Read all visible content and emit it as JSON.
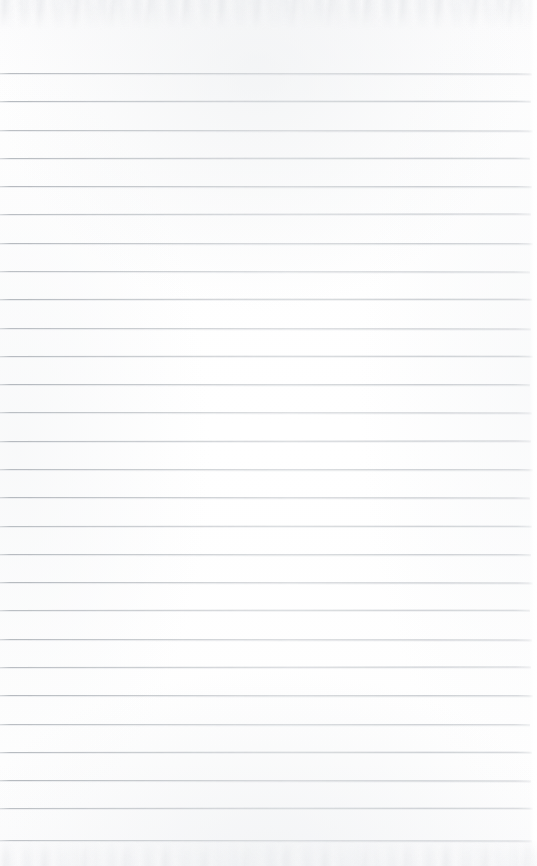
{
  "document": {
    "kind": "scanned-lined-paper",
    "title": "Blank Ruled Notebook Page",
    "written_text": "",
    "page_width": 537,
    "page_height": 866
  },
  "paper": {
    "background_color": "#fdfdfd",
    "edge_noise_color": "#e8eaed",
    "has_vertical_margin_rule": false,
    "has_holes": false,
    "has_handwriting": false,
    "has_printed_text": false
  },
  "ruling": {
    "line_color": "#b4b9bf",
    "line_thickness_px": 1,
    "first_line_y": 73,
    "line_spacing_px": 28.4,
    "line_count": 28,
    "line_start_x": 0,
    "line_end_x": 531,
    "lines": [
      {
        "index": 1,
        "y": 73,
        "tilt_deg": 0.06,
        "end_x": 532,
        "opacity": 0.88
      },
      {
        "index": 2,
        "y": 101,
        "tilt_deg": -0.04,
        "end_x": 531,
        "opacity": 0.92
      },
      {
        "index": 3,
        "y": 130,
        "tilt_deg": 0.05,
        "end_x": 533,
        "opacity": 0.86
      },
      {
        "index": 4,
        "y": 158,
        "tilt_deg": -0.03,
        "end_x": 530,
        "opacity": 0.9
      },
      {
        "index": 5,
        "y": 186,
        "tilt_deg": 0.04,
        "end_x": 532,
        "opacity": 0.93
      },
      {
        "index": 6,
        "y": 214,
        "tilt_deg": -0.05,
        "end_x": 531,
        "opacity": 0.87
      },
      {
        "index": 7,
        "y": 243,
        "tilt_deg": 0.03,
        "end_x": 533,
        "opacity": 0.91
      },
      {
        "index": 8,
        "y": 271,
        "tilt_deg": 0.06,
        "end_x": 530,
        "opacity": 0.85
      },
      {
        "index": 9,
        "y": 299,
        "tilt_deg": -0.04,
        "end_x": 532,
        "opacity": 0.92
      },
      {
        "index": 10,
        "y": 328,
        "tilt_deg": 0.05,
        "end_x": 531,
        "opacity": 0.88
      },
      {
        "index": 11,
        "y": 356,
        "tilt_deg": -0.03,
        "end_x": 533,
        "opacity": 0.9
      },
      {
        "index": 12,
        "y": 384,
        "tilt_deg": 0.04,
        "end_x": 530,
        "opacity": 0.94
      },
      {
        "index": 13,
        "y": 412,
        "tilt_deg": 0.06,
        "end_x": 532,
        "opacity": 0.86
      },
      {
        "index": 14,
        "y": 441,
        "tilt_deg": -0.05,
        "end_x": 531,
        "opacity": 0.91
      },
      {
        "index": 15,
        "y": 469,
        "tilt_deg": 0.03,
        "end_x": 533,
        "opacity": 0.89
      },
      {
        "index": 16,
        "y": 497,
        "tilt_deg": 0.05,
        "end_x": 530,
        "opacity": 0.93
      },
      {
        "index": 17,
        "y": 526,
        "tilt_deg": -0.04,
        "end_x": 532,
        "opacity": 0.87
      },
      {
        "index": 18,
        "y": 554,
        "tilt_deg": 0.04,
        "end_x": 531,
        "opacity": 0.9
      },
      {
        "index": 19,
        "y": 582,
        "tilt_deg": 0.06,
        "end_x": 533,
        "opacity": 0.92
      },
      {
        "index": 20,
        "y": 610,
        "tilt_deg": -0.03,
        "end_x": 530,
        "opacity": 0.86
      },
      {
        "index": 21,
        "y": 639,
        "tilt_deg": 0.05,
        "end_x": 532,
        "opacity": 0.91
      },
      {
        "index": 22,
        "y": 667,
        "tilt_deg": -0.05,
        "end_x": 531,
        "opacity": 0.88
      },
      {
        "index": 23,
        "y": 695,
        "tilt_deg": 0.04,
        "end_x": 533,
        "opacity": 0.93
      },
      {
        "index": 24,
        "y": 724,
        "tilt_deg": 0.03,
        "end_x": 530,
        "opacity": 0.87
      },
      {
        "index": 25,
        "y": 752,
        "tilt_deg": -0.04,
        "end_x": 532,
        "opacity": 0.9
      },
      {
        "index": 26,
        "y": 780,
        "tilt_deg": 0.06,
        "end_x": 531,
        "opacity": 0.92
      },
      {
        "index": 27,
        "y": 808,
        "tilt_deg": -0.03,
        "end_x": 533,
        "opacity": 0.85
      },
      {
        "index": 28,
        "y": 840,
        "tilt_deg": 0.05,
        "end_x": 532,
        "opacity": 0.78
      }
    ]
  }
}
